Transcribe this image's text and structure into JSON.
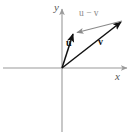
{
  "figure": {
    "kind": "vector-subtraction-diagram",
    "width": 135,
    "height": 132,
    "background_color": "#ffffff"
  },
  "axes": {
    "x_label": "x",
    "y_label": "y",
    "color": "#9a9a9a",
    "origin": {
      "x": 62,
      "y": 68
    },
    "x_axis": {
      "start_x": 3,
      "end_x": 129,
      "y": 68
    },
    "y_axis": {
      "x": 62,
      "start_y": 132,
      "end_y": 7
    }
  },
  "vectors": [
    {
      "name": "u",
      "label": "u",
      "color": "#111111",
      "from": {
        "x": 62,
        "y": 68
      },
      "to": {
        "x": 74,
        "y": 32
      },
      "label_pos": {
        "x": 66,
        "y": 46
      }
    },
    {
      "name": "v",
      "label": "v",
      "color": "#111111",
      "from": {
        "x": 62,
        "y": 68
      },
      "to": {
        "x": 123,
        "y": 20
      },
      "label_pos": {
        "x": 98,
        "y": 45
      }
    },
    {
      "name": "u-minus-v",
      "label": "u − v",
      "color": "#8a8a8a",
      "from": {
        "x": 122,
        "y": 21
      },
      "to": {
        "x": 75,
        "y": 33
      },
      "label_pos": {
        "x": 79,
        "y": 16
      }
    }
  ]
}
